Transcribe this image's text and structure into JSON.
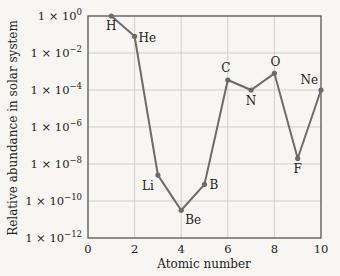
{
  "chart_data": {
    "type": "line",
    "title": "",
    "xlabel": "Atomic number",
    "ylabel": "Relative abundance in solar system",
    "yscale": "log",
    "xlim": [
      0,
      10
    ],
    "ylim_exponents": [
      -12,
      0
    ],
    "xticks": [
      0,
      2,
      4,
      6,
      8,
      10
    ],
    "yticks": [
      "1 × 10^0",
      "1 × 10^-2",
      "1 × 10^-4",
      "1 × 10^-6",
      "1 × 10^-8",
      "1 × 10^-10",
      "1 × 10^-12"
    ],
    "grid": true,
    "series": [
      {
        "name": "Elements",
        "points": [
          {
            "x": 1,
            "label": "H",
            "value": 1.0,
            "log10": 0.0
          },
          {
            "x": 2,
            "label": "He",
            "value": 0.08,
            "log10": -1.1
          },
          {
            "x": 3,
            "label": "Li",
            "value": 2.5e-09,
            "log10": -8.6
          },
          {
            "x": 4,
            "label": "Be",
            "value": 3e-11,
            "log10": -10.5
          },
          {
            "x": 5,
            "label": "B",
            "value": 8e-10,
            "log10": -9.1
          },
          {
            "x": 6,
            "label": "C",
            "value": 0.00035,
            "log10": -3.46
          },
          {
            "x": 7,
            "label": "N",
            "value": 0.0001,
            "log10": -4.0
          },
          {
            "x": 8,
            "label": "O",
            "value": 0.0008,
            "log10": -3.1
          },
          {
            "x": 9,
            "label": "F",
            "value": 2e-08,
            "log10": -7.7
          },
          {
            "x": 10,
            "label": "Ne",
            "value": 0.0001,
            "log10": -4.0
          }
        ]
      }
    ]
  },
  "colors": {
    "line": "#6b6b6b",
    "axis": "#555555",
    "grid": "#cfcfcf",
    "background": "#f7f6f3"
  }
}
